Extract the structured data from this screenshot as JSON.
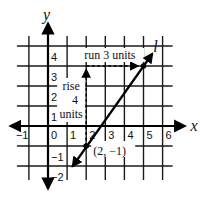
{
  "chart_data": {
    "type": "line",
    "title": "",
    "xlabel": "x",
    "ylabel": "y",
    "xlim": [
      -1,
      6
    ],
    "ylim": [
      -2,
      4
    ],
    "x_ticks": [
      "−1",
      "0",
      "1",
      "2",
      "3",
      "4",
      "5",
      "6"
    ],
    "y_ticks": [
      "4",
      "3",
      "2",
      "1",
      "−1",
      "−2"
    ],
    "grid": true,
    "series": [
      {
        "name": "l",
        "points": [
          [
            2,
            -1
          ],
          [
            5,
            3
          ]
        ],
        "extends_from": [
          1.3,
          -2
        ],
        "extends_to": [
          5.45,
          3.6
        ]
      }
    ],
    "annotations": [
      {
        "type": "point",
        "at": [
          2,
          -1
        ],
        "label": "(2, −1)"
      },
      {
        "type": "point",
        "at": [
          5,
          3
        ]
      },
      {
        "type": "arrow-dashed",
        "from": [
          2,
          -1
        ],
        "to": [
          2,
          3
        ],
        "label": [
          "rise",
          "4",
          "units"
        ]
      },
      {
        "type": "arrow-dashed",
        "from": [
          2,
          3
        ],
        "to": [
          5,
          3
        ],
        "label": "run 3 units"
      }
    ],
    "line_label": "l"
  }
}
